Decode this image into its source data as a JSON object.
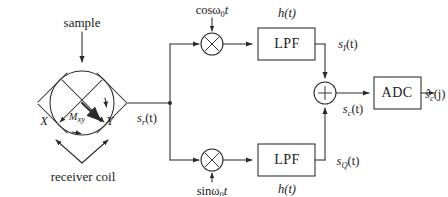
{
  "figure": {
    "background_color": "#ffffff",
    "line_color": "#2a2a2a",
    "text_color": "#1a1a1a"
  },
  "coil": {
    "sample_label": "sample",
    "coil_label": "receiver coil",
    "axis_x_label": "X",
    "axis_y_label": "Y",
    "magnetization_label": "M",
    "magnetization_sub": "xy",
    "output_signal": "s",
    "output_signal_sub": "r",
    "output_signal_arg": "(t)"
  },
  "branch_i": {
    "mixer_symbol": "×",
    "lo_label_fn": "cos",
    "lo_label_omega": "ω",
    "lo_label_sub": "0",
    "lo_label_t": "t",
    "filter_label": "LPF",
    "filter_impulse": "h(t)",
    "out_signal": "s",
    "out_signal_sub": "I",
    "out_signal_arg": "(t)"
  },
  "branch_q": {
    "mixer_symbol": "×",
    "lo_label_fn": "sin",
    "lo_label_omega": "ω",
    "lo_label_sub": "0",
    "lo_label_t": "t",
    "filter_label": "LPF",
    "filter_impulse": "h(t)",
    "out_signal": "s",
    "out_signal_sub": "Q",
    "out_signal_arg": "(t)"
  },
  "adder": {
    "symbol": "+",
    "out_signal": "s",
    "out_signal_sub": "c",
    "out_signal_arg": "(t)"
  },
  "adc": {
    "label": "ADC",
    "out_signal": "ŝ",
    "out_signal_sub": "c",
    "out_signal_arg": "(j)"
  }
}
